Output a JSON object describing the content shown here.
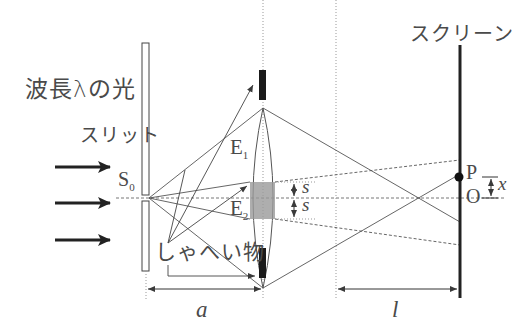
{
  "diagram": {
    "labels": {
      "light": "波長λの光",
      "slit": "スリット",
      "source": "S",
      "source_sub": "0",
      "e1": "E",
      "e1_sub": "1",
      "e2": "E",
      "e2_sub": "2",
      "obstacle": "しゃへい物",
      "screen": "スクリーン",
      "point_p": "P",
      "point_o": "O",
      "s_upper": "s",
      "s_lower": "s",
      "x": "x",
      "a": "a",
      "l": "l"
    },
    "colors": {
      "line": "#3a3a3a",
      "thin_line": "#555555",
      "dashed": "#777777",
      "shaded": "#9a9a9a",
      "text": "#4a4a4a"
    },
    "geometry": {
      "slit_x": 146,
      "axis_y": 198,
      "lens_x": 263,
      "focal_plane_x": 336,
      "screen_x": 460,
      "p_y": 176
    }
  }
}
